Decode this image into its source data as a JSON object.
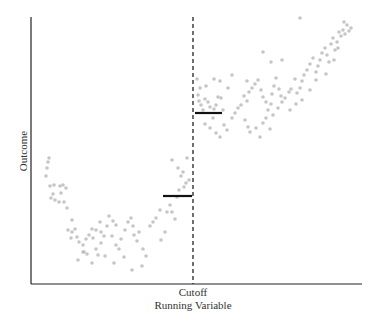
{
  "chart_data": {
    "type": "scatter",
    "title": "",
    "xlabel": "Running Variable",
    "ylabel": "Outcome",
    "annotations": [
      "Cutoff"
    ],
    "grid": false,
    "legend": null,
    "cutoff_x": 0.5,
    "xlim": [
      0,
      1
    ],
    "ylim": [
      0,
      1
    ],
    "fitted_segments": [
      {
        "name": "left_limit",
        "x": [
          0.4,
          0.49
        ],
        "y": [
          0.33,
          0.33
        ]
      },
      {
        "name": "right_limit",
        "x": [
          0.5,
          0.58
        ],
        "y": [
          0.64,
          0.64
        ]
      }
    ],
    "points_px": [
      [
        48,
        162
      ],
      [
        47,
        168
      ],
      [
        49,
        158
      ],
      [
        46,
        176
      ],
      [
        50,
        186
      ],
      [
        54,
        185
      ],
      [
        53,
        194
      ],
      [
        60,
        186
      ],
      [
        63,
        185
      ],
      [
        66,
        188
      ],
      [
        61,
        193
      ],
      [
        59,
        202
      ],
      [
        64,
        202
      ],
      [
        67,
        208
      ],
      [
        51,
        198
      ],
      [
        55,
        200
      ],
      [
        72,
        220
      ],
      [
        68,
        230
      ],
      [
        72,
        232
      ],
      [
        75,
        229
      ],
      [
        77,
        237
      ],
      [
        71,
        238
      ],
      [
        79,
        242
      ],
      [
        83,
        245
      ],
      [
        86,
        239
      ],
      [
        89,
        235
      ],
      [
        93,
        238
      ],
      [
        92,
        229
      ],
      [
        96,
        230
      ],
      [
        100,
        222
      ],
      [
        101,
        232
      ],
      [
        104,
        236
      ],
      [
        109,
        216
      ],
      [
        107,
        226
      ],
      [
        113,
        221
      ],
      [
        116,
        225
      ],
      [
        112,
        236
      ],
      [
        116,
        245
      ],
      [
        119,
        249
      ],
      [
        121,
        239
      ],
      [
        125,
        230
      ],
      [
        128,
        222
      ],
      [
        131,
        218
      ],
      [
        133,
        226
      ],
      [
        134,
        235
      ],
      [
        137,
        241
      ],
      [
        139,
        232
      ],
      [
        143,
        249
      ],
      [
        146,
        256
      ],
      [
        142,
        266
      ],
      [
        132,
        270
      ],
      [
        124,
        257
      ],
      [
        114,
        263
      ],
      [
        105,
        256
      ],
      [
        98,
        255
      ],
      [
        92,
        263
      ],
      [
        87,
        254
      ],
      [
        84,
        252
      ],
      [
        78,
        260
      ],
      [
        83,
        252
      ],
      [
        96,
        249
      ],
      [
        101,
        243
      ],
      [
        150,
        226
      ],
      [
        153,
        222
      ],
      [
        156,
        218
      ],
      [
        160,
        210
      ],
      [
        161,
        240
      ],
      [
        165,
        232
      ],
      [
        167,
        212
      ],
      [
        170,
        205
      ],
      [
        172,
        212
      ],
      [
        175,
        219
      ],
      [
        177,
        197
      ],
      [
        179,
        190
      ],
      [
        184,
        187
      ],
      [
        186,
        183
      ],
      [
        181,
        176
      ],
      [
        178,
        168
      ],
      [
        172,
        160
      ],
      [
        189,
        180
      ],
      [
        187,
        158
      ],
      [
        183,
        172
      ],
      [
        197,
        79
      ],
      [
        198,
        95
      ],
      [
        199,
        101
      ],
      [
        201,
        105
      ],
      [
        203,
        110
      ],
      [
        205,
        99
      ],
      [
        208,
        102
      ],
      [
        210,
        107
      ],
      [
        214,
        109
      ],
      [
        216,
        105
      ],
      [
        218,
        97
      ],
      [
        221,
        98
      ],
      [
        223,
        110
      ],
      [
        213,
        118
      ],
      [
        205,
        124
      ],
      [
        210,
        128
      ],
      [
        216,
        133
      ],
      [
        220,
        137
      ],
      [
        224,
        125
      ],
      [
        227,
        130
      ],
      [
        232,
        118
      ],
      [
        235,
        113
      ],
      [
        238,
        108
      ],
      [
        241,
        105
      ],
      [
        244,
        96
      ],
      [
        247,
        101
      ],
      [
        249,
        92
      ],
      [
        252,
        88
      ],
      [
        255,
        84
      ],
      [
        258,
        80
      ],
      [
        261,
        90
      ],
      [
        263,
        97
      ],
      [
        266,
        102
      ],
      [
        268,
        110
      ],
      [
        271,
        104
      ],
      [
        272,
        94
      ],
      [
        274,
        86
      ],
      [
        276,
        78
      ],
      [
        279,
        89
      ],
      [
        281,
        96
      ],
      [
        245,
        120
      ],
      [
        248,
        127
      ],
      [
        250,
        132
      ],
      [
        256,
        128
      ],
      [
        260,
        137
      ],
      [
        263,
        123
      ],
      [
        266,
        118
      ],
      [
        270,
        129
      ],
      [
        273,
        115
      ],
      [
        278,
        108
      ],
      [
        282,
        102
      ],
      [
        285,
        98
      ],
      [
        289,
        92
      ],
      [
        291,
        89
      ],
      [
        295,
        79
      ],
      [
        297,
        93
      ],
      [
        300,
        88
      ],
      [
        302,
        81
      ],
      [
        304,
        75
      ],
      [
        307,
        70
      ],
      [
        310,
        64
      ],
      [
        313,
        58
      ],
      [
        316,
        72
      ],
      [
        318,
        66
      ],
      [
        320,
        60
      ],
      [
        322,
        53
      ],
      [
        325,
        48
      ],
      [
        327,
        55
      ],
      [
        329,
        62
      ],
      [
        331,
        44
      ],
      [
        333,
        38
      ],
      [
        335,
        50
      ],
      [
        337,
        42
      ],
      [
        339,
        32
      ],
      [
        341,
        36
      ],
      [
        343,
        30
      ],
      [
        345,
        34
      ],
      [
        347,
        25
      ],
      [
        349,
        31
      ],
      [
        351,
        28
      ],
      [
        310,
        90
      ],
      [
        316,
        80
      ],
      [
        302,
        100
      ],
      [
        290,
        110
      ],
      [
        296,
        104
      ],
      [
        326,
        74
      ],
      [
        334,
        60
      ],
      [
        338,
        48
      ],
      [
        344,
        22
      ],
      [
        300,
        18
      ],
      [
        282,
        60
      ],
      [
        271,
        62
      ],
      [
        263,
        52
      ],
      [
        247,
        81
      ],
      [
        232,
        75
      ],
      [
        228,
        88
      ],
      [
        220,
        81
      ],
      [
        214,
        79
      ],
      [
        206,
        86
      ],
      [
        200,
        88
      ]
    ],
    "point_color": "#b8b8b8",
    "line_color": "#111111"
  },
  "labels": {
    "ylabel": "Outcome",
    "cutoff": "Cutoff",
    "xlabel": "Running Variable"
  }
}
